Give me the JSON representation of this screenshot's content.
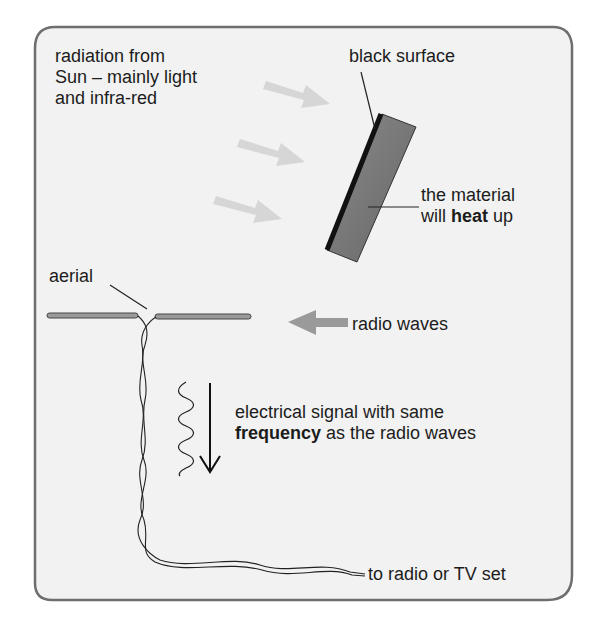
{
  "diagram": {
    "radiation_label": [
      "radiation from",
      "Sun – mainly light",
      "and infra-red"
    ],
    "black_surface_label": "black surface",
    "heat_label": {
      "line1": "the material",
      "line2_pre": "will ",
      "line2_bold": "heat",
      "line2_post": " up"
    },
    "aerial_label": "aerial",
    "radio_waves_label": "radio waves",
    "signal_label": {
      "line1": "electrical signal with same",
      "line2_bold": "frequency",
      "line2_post": " as the radio waves"
    },
    "output_label": "to radio or TV set",
    "colors": {
      "panel_bg": "#f2f2f2",
      "panel_border": "#6e6e6e",
      "sun_arrow": "#d9d9d9",
      "radio_arrow": "#9a9a9a",
      "plate": "#7a7a7a",
      "black_surface": "#111111"
    }
  }
}
